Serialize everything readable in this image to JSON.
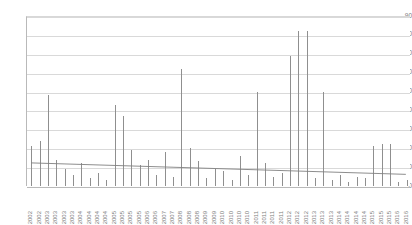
{
  "chart_data": {
    "type": "bar",
    "title": "",
    "xlabel": "",
    "ylabel": "",
    "ylim": [
      0,
      90
    ],
    "ytick_step": 10,
    "yticks": [
      90,
      80,
      70,
      60,
      50,
      40,
      30,
      20,
      10,
      0
    ],
    "grid": true,
    "legend": false,
    "legend_position": "none",
    "categories": [
      "2002",
      "2002",
      "2003",
      "2003",
      "2003",
      "2003",
      "2004",
      "2004",
      "2004",
      "2004",
      "2005",
      "2005",
      "2005",
      "2005",
      "2006",
      "2006",
      "2007",
      "2007",
      "2008",
      "2008",
      "2008",
      "2009",
      "2009",
      "2010",
      "2010",
      "2010",
      "2010",
      "2011",
      "2011",
      "2011",
      "2011",
      "2012",
      "2012",
      "2012",
      "2013",
      "2013",
      "2013",
      "2014",
      "2014",
      "2014",
      "2014",
      "2015",
      "2015",
      "2015",
      "2016",
      "2016"
    ],
    "values": [
      21,
      24,
      48,
      14,
      9,
      6,
      12,
      4,
      7,
      3,
      43,
      37,
      19,
      11,
      14,
      6,
      18,
      5,
      62,
      20,
      13,
      4,
      9,
      8,
      3,
      16,
      6,
      50,
      12,
      5,
      7,
      69,
      82,
      82,
      4,
      50,
      3,
      6,
      2,
      5,
      4,
      21,
      22,
      22,
      2,
      3
    ],
    "series": [
      {
        "name": "values",
        "values": [
          21,
          24,
          48,
          14,
          9,
          6,
          12,
          4,
          7,
          3,
          43,
          37,
          19,
          11,
          14,
          6,
          18,
          5,
          62,
          20,
          13,
          4,
          9,
          8,
          3,
          16,
          6,
          50,
          12,
          5,
          7,
          69,
          82,
          82,
          4,
          50,
          3,
          6,
          2,
          5,
          4,
          21,
          22,
          22,
          2,
          3
        ]
      }
    ],
    "trendline": {
      "type": "linear",
      "start_value": 12.3,
      "end_value": 6.2
    },
    "xtick_labels": [
      "2002",
      "2002",
      "2003",
      "2003",
      "2003",
      "2003",
      "2004",
      "2004",
      "2004",
      "2004",
      "2005",
      "2005",
      "2005",
      "2005",
      "2006",
      "2006",
      "2007",
      "2007",
      "2008",
      "2008",
      "2008",
      "2009",
      "2009",
      "2010",
      "2010",
      "2010",
      "2010",
      "2011",
      "2011",
      "2011",
      "2011",
      "2012",
      "2012",
      "2012",
      "2013",
      "2013",
      "2013",
      "2014",
      "2014",
      "2014",
      "2014",
      "2015",
      "2015",
      "2015",
      "2016",
      "2016"
    ],
    "colors": {
      "bar": "#8f8f8f",
      "grid": "#d9d9d9",
      "axis": "#b9b9b9",
      "trend": "#808080",
      "tick_text": "#7d7d7d",
      "background": "#ffffff"
    }
  }
}
